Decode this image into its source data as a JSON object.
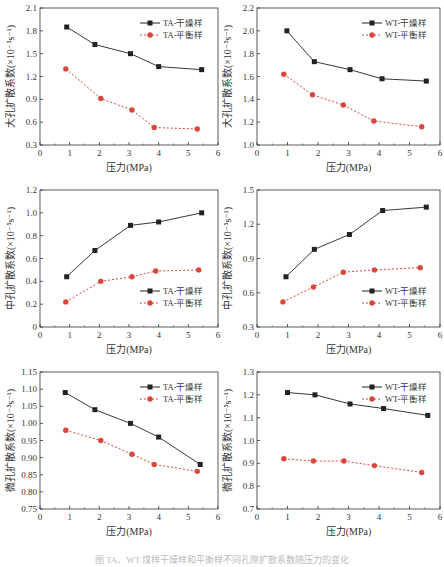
{
  "caption": "图 TA、WT 煤样干燥样和平衡样不同孔隙扩散系数随压力的变化",
  "chart_data": [
    {
      "type": "line",
      "id": "macro-TA",
      "title": "",
      "xlabel": "压力(MPa)",
      "ylabel": "大孔扩散系数(×10⁻⁵s⁻¹)",
      "xlim": [
        0,
        6
      ],
      "ylim": [
        0.3,
        2.1
      ],
      "xticks": [
        0,
        1,
        2,
        3,
        4,
        5,
        6
      ],
      "yticks": [
        0.3,
        0.6,
        0.9,
        1.2,
        1.5,
        1.8,
        2.1
      ],
      "ytick_labels": [
        "0.3",
        "0.6",
        "0.9",
        "1.2",
        "1.5",
        "1.8",
        "2.1"
      ],
      "legend_position": "upper right",
      "series": [
        {
          "name": "TA-干燥样",
          "x": [
            0.9,
            1.85,
            3.05,
            4.0,
            5.45
          ],
          "values": [
            1.85,
            1.62,
            1.5,
            1.33,
            1.29
          ]
        },
        {
          "name": "TA-平衡样",
          "x": [
            0.87,
            2.05,
            3.1,
            3.85,
            5.3
          ],
          "values": [
            1.3,
            0.91,
            0.76,
            0.53,
            0.51
          ]
        }
      ]
    },
    {
      "type": "line",
      "id": "macro-WT",
      "title": "",
      "xlabel": "压力(MPa)",
      "ylabel": "大孔扩散系数(×10⁻⁵s⁻¹)",
      "xlim": [
        0,
        6
      ],
      "ylim": [
        1.0,
        2.2
      ],
      "xticks": [
        0,
        1,
        2,
        3,
        4,
        5,
        6
      ],
      "yticks": [
        1.0,
        1.2,
        1.4,
        1.6,
        1.8,
        2.0,
        2.2
      ],
      "ytick_labels": [
        "1.0",
        "1.2",
        "1.4",
        "1.6",
        "1.8",
        "2.0",
        "2.2"
      ],
      "legend_position": "upper right",
      "series": [
        {
          "name": "WT-干燥样",
          "x": [
            0.98,
            1.88,
            3.05,
            4.1,
            5.55
          ],
          "values": [
            2.0,
            1.73,
            1.66,
            1.58,
            1.56
          ]
        },
        {
          "name": "WT-平衡样",
          "x": [
            0.88,
            1.82,
            2.83,
            3.83,
            5.4
          ],
          "values": [
            1.62,
            1.44,
            1.35,
            1.21,
            1.16
          ]
        }
      ]
    },
    {
      "type": "line",
      "id": "meso-TA",
      "title": "",
      "xlabel": "压力(MPa)",
      "ylabel": "中孔扩散系数(×10⁻⁵s⁻¹)",
      "xlim": [
        0,
        6
      ],
      "ylim": [
        0,
        1.2
      ],
      "xticks": [
        0,
        1,
        2,
        3,
        4,
        5,
        6
      ],
      "yticks": [
        0,
        0.2,
        0.4,
        0.6,
        0.8,
        1.0,
        1.2
      ],
      "ytick_labels": [
        "0",
        "0.2",
        "0.4",
        "0.6",
        "0.8",
        "1.0",
        "1.2"
      ],
      "legend_position": "lower right",
      "series": [
        {
          "name": "TA-干燥样",
          "x": [
            0.9,
            1.85,
            3.05,
            4.0,
            5.45
          ],
          "values": [
            0.44,
            0.67,
            0.89,
            0.92,
            1.0
          ]
        },
        {
          "name": "TA-平衡样",
          "x": [
            0.87,
            2.05,
            3.1,
            3.9,
            5.35
          ],
          "values": [
            0.22,
            0.4,
            0.44,
            0.49,
            0.5
          ]
        }
      ]
    },
    {
      "type": "line",
      "id": "meso-WT",
      "title": "",
      "xlabel": "压力(MPa)",
      "ylabel": "中孔扩散系数(×10⁻⁵s⁻¹)",
      "xlim": [
        0,
        6
      ],
      "ylim": [
        0.3,
        1.5
      ],
      "xticks": [
        0,
        1,
        2,
        3,
        4,
        5,
        6
      ],
      "yticks": [
        0.3,
        0.6,
        0.9,
        1.2,
        1.5
      ],
      "ytick_labels": [
        "0.3",
        "0.6",
        "0.9",
        "1.2",
        "1.5"
      ],
      "legend_position": "lower right",
      "series": [
        {
          "name": "WT-干燥样",
          "x": [
            0.95,
            1.88,
            3.03,
            4.12,
            5.55
          ],
          "values": [
            0.74,
            0.98,
            1.11,
            1.32,
            1.35
          ]
        },
        {
          "name": "WT-平衡样",
          "x": [
            0.85,
            1.85,
            2.83,
            3.85,
            5.35
          ],
          "values": [
            0.52,
            0.65,
            0.78,
            0.8,
            0.82
          ]
        }
      ]
    },
    {
      "type": "line",
      "id": "micro-TA",
      "title": "",
      "xlabel": "压力(MPa)",
      "ylabel": "微孔扩散系数(×10⁻⁵s⁻¹)",
      "xlim": [
        0,
        6
      ],
      "ylim": [
        0.75,
        1.15
      ],
      "xticks": [
        0,
        1,
        2,
        3,
        4,
        5,
        6
      ],
      "yticks": [
        0.75,
        0.8,
        0.85,
        0.9,
        0.95,
        1.0,
        1.05,
        1.1,
        1.15
      ],
      "ytick_labels": [
        "0.75",
        "0.80",
        "0.85",
        "0.90",
        "0.95",
        "1.00",
        "1.05",
        "1.10",
        "1.15"
      ],
      "legend_position": "upper right",
      "series": [
        {
          "name": "TA-干燥样",
          "x": [
            0.85,
            1.85,
            3.05,
            4.0,
            5.4
          ],
          "values": [
            1.09,
            1.04,
            1.0,
            0.96,
            0.88
          ]
        },
        {
          "name": "TA-平衡样",
          "x": [
            0.87,
            2.05,
            3.1,
            3.85,
            5.3
          ],
          "values": [
            0.98,
            0.95,
            0.91,
            0.88,
            0.86
          ]
        }
      ]
    },
    {
      "type": "line",
      "id": "micro-WT",
      "title": "",
      "xlabel": "压力(MPa)",
      "ylabel": "微孔扩散系数(×10⁻⁵s⁻¹)",
      "xlim": [
        0,
        6
      ],
      "ylim": [
        0.7,
        1.3
      ],
      "xticks": [
        0,
        1,
        2,
        3,
        4,
        5,
        6
      ],
      "yticks": [
        0.7,
        0.8,
        0.9,
        1.0,
        1.1,
        1.2,
        1.3
      ],
      "ytick_labels": [
        "0.7",
        "0.8",
        "0.9",
        "1.0",
        "1.1",
        "1.2",
        "1.3"
      ],
      "legend_position": "upper right",
      "series": [
        {
          "name": "WT-干燥样",
          "x": [
            1.0,
            1.9,
            3.05,
            4.15,
            5.6
          ],
          "values": [
            1.21,
            1.2,
            1.16,
            1.14,
            1.11
          ]
        },
        {
          "name": "WT-平衡样",
          "x": [
            0.88,
            1.85,
            2.85,
            3.85,
            5.4
          ],
          "values": [
            0.92,
            0.91,
            0.91,
            0.89,
            0.86
          ]
        }
      ]
    }
  ],
  "style": {
    "dry_color": "#222222",
    "eq_color": "#d9473b",
    "axis_color": "#333333"
  }
}
